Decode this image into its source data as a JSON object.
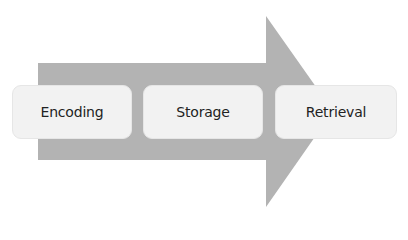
{
  "diagram": {
    "type": "process-arrow",
    "direction": "left-to-right",
    "colors": {
      "arrow": "#b3b3b3",
      "box_fill": "#f2f2f2",
      "box_border": "#e6e6e6",
      "text": "#222222"
    },
    "stages": [
      {
        "label": "Encoding"
      },
      {
        "label": "Storage"
      },
      {
        "label": "Retrieval"
      }
    ]
  }
}
